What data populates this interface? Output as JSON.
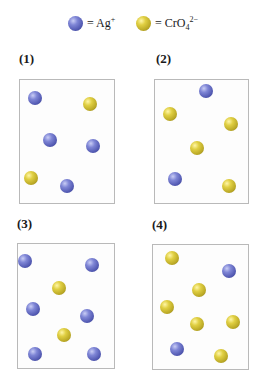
{
  "legend": {
    "items": [
      {
        "icon": "blue-sphere",
        "species": "silver-ion",
        "text_prefix": "= Ag",
        "superscript": "+",
        "subscript": "",
        "color": "#5b61bd"
      },
      {
        "icon": "yellow-sphere",
        "species": "chromate-ion",
        "text_prefix": "= CrO",
        "subscript": "4",
        "superscript": "2−",
        "color": "#c9b830"
      }
    ]
  },
  "panels": [
    {
      "label": "(1)",
      "ag_count": 4,
      "cro4_count": 2
    },
    {
      "label": "(2)",
      "ag_count": 2,
      "cro4_count": 4
    },
    {
      "label": "(3)",
      "ag_count": 6,
      "cro4_count": 2
    },
    {
      "label": "(4)",
      "ag_count": 2,
      "cro4_count": 6
    }
  ],
  "colors": {
    "ag": "#5b61bd",
    "cro4": "#c9b830",
    "box_border": "#b9b9b9"
  }
}
